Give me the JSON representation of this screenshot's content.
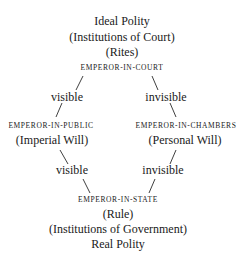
{
  "diagram": {
    "top": {
      "title": "Ideal Polity",
      "sub1": "(Institutions of Court)",
      "sub2": "(Rites)",
      "node": "EMPEROR-IN-COURT"
    },
    "left_upper_edge": "visible",
    "right_upper_edge": "invisible",
    "left": {
      "node": "EMPEROR-IN-PUBLIC",
      "sub": "(Imperial Will)"
    },
    "right": {
      "node": "EMPEROR-IN-CHAMBERS",
      "sub": "(Personal Will)"
    },
    "left_lower_edge": "visible",
    "right_lower_edge": "invisible",
    "bottom": {
      "node": "EMPEROR-IN-STATE",
      "sub1": "(Rule)",
      "sub2": "(Institutions of Government)",
      "title": "Real Polity"
    }
  }
}
